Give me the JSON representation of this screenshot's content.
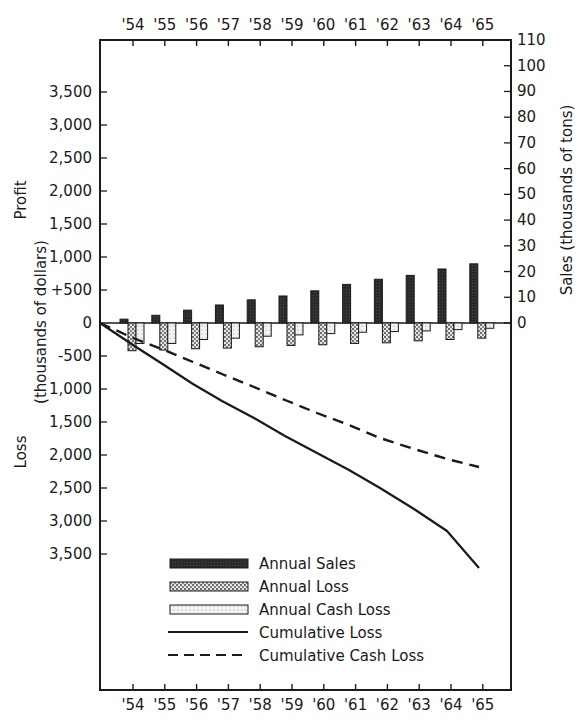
{
  "chart_data": {
    "type": "bar",
    "title": "",
    "categories": [
      "'54",
      "'55",
      "'56",
      "'57",
      "'58",
      "'59",
      "'60",
      "'61",
      "'62",
      "'63",
      "'64",
      "'65"
    ],
    "left_axis": {
      "label_top": "Profit",
      "label_middle": "(thousands of dollars)",
      "label_bottom": "Loss",
      "ticks_profit": [
        "3,500",
        "3,000",
        "2,500",
        "2,000",
        "1,500",
        "1,000",
        "+500"
      ],
      "tick_zero": "0",
      "ticks_loss": [
        "-500",
        "1,000",
        "1,500",
        "2,000",
        "2,500",
        "3,000",
        "3,500"
      ],
      "range": [
        -3500,
        3500
      ]
    },
    "right_axis": {
      "label": "Sales (thousands of tons)",
      "ticks": [
        "110",
        "100",
        "90",
        "80",
        "70",
        "60",
        "50",
        "40",
        "30",
        "20",
        "10",
        "0"
      ],
      "range": [
        0,
        110
      ]
    },
    "series": [
      {
        "name": "Annual Sales",
        "axis": "right",
        "kind": "bar",
        "unit": "thousands of tons",
        "values": [
          1.5,
          3,
          5,
          7,
          9,
          10.5,
          12.5,
          15,
          17,
          18.5,
          21,
          23
        ]
      },
      {
        "name": "Annual Loss",
        "axis": "left",
        "kind": "bar",
        "unit": "thousands of dollars",
        "values": [
          -420,
          -410,
          -390,
          -380,
          -360,
          -340,
          -330,
          -310,
          -300,
          -270,
          -250,
          -230
        ]
      },
      {
        "name": "Annual Cash Loss",
        "axis": "left",
        "kind": "bar",
        "unit": "thousands of dollars",
        "values": [
          -310,
          -310,
          -250,
          -230,
          -200,
          -180,
          -160,
          -140,
          -130,
          -120,
          -100,
          -80
        ]
      },
      {
        "name": "Cumulative Loss",
        "axis": "left",
        "kind": "line",
        "style": "solid",
        "unit": "thousands of dollars",
        "values": [
          -420,
          -830,
          -1220,
          -1600,
          -1960,
          -2300,
          -2630,
          -2940,
          -3240,
          -3510,
          -3760,
          -3700
        ]
      },
      {
        "name": "Cumulative Cash Loss",
        "axis": "left",
        "kind": "line",
        "style": "dashed",
        "unit": "thousands of dollars",
        "values": [
          -310,
          -620,
          -870,
          -1100,
          -1300,
          -1480,
          -1640,
          -1780,
          -1910,
          -2030,
          -2130,
          -2200
        ]
      }
    ],
    "legend": [
      "Annual Sales",
      "Annual Loss",
      "Annual Cash Loss",
      "Cumulative Loss",
      "Cumulative Cash Loss"
    ],
    "legend_position": "lower-left inside plot",
    "grid": false
  },
  "x_ticks_top": [
    "'54",
    "'55",
    "'56",
    "'57",
    "'58",
    "'59",
    "'60",
    "'61",
    "'62",
    "'63",
    "'64",
    "'65"
  ],
  "x_ticks_bottom": [
    "'54",
    "'55",
    "'56",
    "'57",
    "'58",
    "'59",
    "'60",
    "'61",
    "'62",
    "'63",
    "'64",
    "'65"
  ],
  "labels": {
    "profit": "Profit",
    "units_left": "(thousands of dollars)",
    "loss": "Loss",
    "right": "Sales (thousands of tons)"
  },
  "legend": {
    "items": [
      {
        "label": "Annual Sales"
      },
      {
        "label": "Annual Loss"
      },
      {
        "label": "Annual Cash Loss"
      },
      {
        "label": "Cumulative Loss"
      },
      {
        "label": "Cumulative Cash Loss"
      }
    ]
  },
  "colors": {
    "ink": "#1a1a1a",
    "sales_fill": "#2a2a2a",
    "loss_fill": "#9a9a9a",
    "cash_loss_fill": "#d8d8d8",
    "background": "#ffffff"
  }
}
